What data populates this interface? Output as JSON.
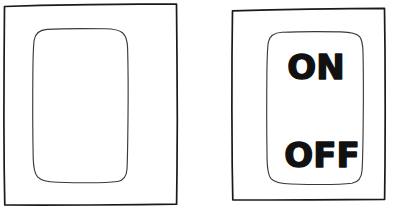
{
  "figure": {
    "background_color": "#ffffff",
    "ink_color": "#1a1a1a",
    "stroke_color_inner": "#3a3a3a",
    "style": "hand-drawn line art"
  },
  "panels": [
    {
      "id": "left-panel",
      "name": "blank-switch-panel",
      "label": "",
      "has_text": false,
      "outer": {
        "x": 3,
        "y": 4,
        "width": 174,
        "height": 201
      },
      "rocker": {
        "x": 33,
        "y": 29,
        "width": 95,
        "height": 153,
        "corner_radius": 14
      }
    },
    {
      "id": "right-panel",
      "name": "on-off-switch-panel",
      "has_text": true,
      "outer": {
        "x": 231,
        "y": 8,
        "width": 154,
        "height": 192
      },
      "rocker": {
        "x": 268,
        "y": 32,
        "width": 94,
        "height": 152,
        "corner_radius": 14
      },
      "labels": [
        {
          "id": "on",
          "text": "ON",
          "x": 316,
          "y": 79
        },
        {
          "id": "off",
          "text": "OFF",
          "x": 322,
          "y": 167
        }
      ]
    }
  ],
  "labels": {
    "on": "ON",
    "off": "OFF"
  }
}
